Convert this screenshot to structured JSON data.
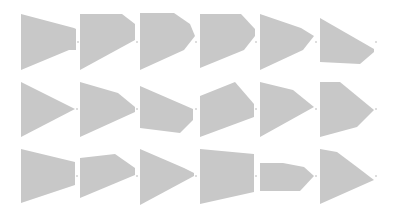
{
  "grid": {
    "rows": 3,
    "cols": 6,
    "fill_color": "#c8c8c8",
    "dot_color": "#b4b4b4"
  },
  "shapes": [
    {
      "row": 1,
      "col": 1,
      "points": [
        [
          21,
          14
        ],
        [
          74,
          28
        ],
        [
          76,
          29
        ],
        [
          76,
          50
        ],
        [
          69,
          50
        ],
        [
          21,
          70
        ]
      ],
      "dot": [
        78,
        42
      ]
    },
    {
      "row": 1,
      "col": 2,
      "points": [
        [
          80,
          14
        ],
        [
          122,
          14
        ],
        [
          135,
          24
        ],
        [
          135,
          40
        ],
        [
          80,
          70
        ]
      ],
      "dot": [
        137,
        42
      ]
    },
    {
      "row": 1,
      "col": 3,
      "points": [
        [
          140,
          13
        ],
        [
          174,
          13
        ],
        [
          190,
          24
        ],
        [
          195,
          36
        ],
        [
          184,
          50
        ],
        [
          140,
          70
        ]
      ],
      "dot": [
        196,
        42
      ]
    },
    {
      "row": 1,
      "col": 4,
      "points": [
        [
          200,
          14
        ],
        [
          241,
          14
        ],
        [
          255,
          29
        ],
        [
          255,
          36
        ],
        [
          244,
          50
        ],
        [
          200,
          68
        ]
      ],
      "dot": [
        256,
        42
      ]
    },
    {
      "row": 1,
      "col": 5,
      "points": [
        [
          260,
          14
        ],
        [
          301,
          28
        ],
        [
          314,
          36
        ],
        [
          303,
          50
        ],
        [
          260,
          70
        ]
      ],
      "dot": [
        316,
        42
      ]
    },
    {
      "row": 1,
      "col": 6,
      "points": [
        [
          320,
          18
        ],
        [
          374,
          49
        ],
        [
          374,
          52
        ],
        [
          360,
          64
        ],
        [
          320,
          62
        ]
      ],
      "dot": [
        376,
        42
      ]
    },
    {
      "row": 2,
      "col": 1,
      "points": [
        [
          21,
          82
        ],
        [
          75,
          109
        ],
        [
          21,
          137
        ]
      ],
      "dot": [
        77,
        109
      ]
    },
    {
      "row": 2,
      "col": 2,
      "points": [
        [
          80,
          82
        ],
        [
          118,
          93
        ],
        [
          135,
          107
        ],
        [
          135,
          112
        ],
        [
          80,
          137
        ]
      ],
      "dot": [
        137,
        109
      ]
    },
    {
      "row": 2,
      "col": 3,
      "points": [
        [
          140,
          86
        ],
        [
          193,
          109
        ],
        [
          193,
          120
        ],
        [
          180,
          133
        ],
        [
          140,
          128
        ]
      ],
      "dot": [
        196,
        109
      ]
    },
    {
      "row": 2,
      "col": 4,
      "points": [
        [
          200,
          96
        ],
        [
          235,
          82
        ],
        [
          254,
          104
        ],
        [
          254,
          117
        ],
        [
          200,
          137
        ]
      ],
      "dot": [
        256,
        109
      ]
    },
    {
      "row": 2,
      "col": 5,
      "points": [
        [
          260,
          82
        ],
        [
          293,
          90
        ],
        [
          314,
          107
        ],
        [
          260,
          137
        ]
      ],
      "dot": [
        316,
        109
      ]
    },
    {
      "row": 2,
      "col": 6,
      "points": [
        [
          320,
          82
        ],
        [
          340,
          82
        ],
        [
          374,
          110
        ],
        [
          357,
          127
        ],
        [
          320,
          137
        ]
      ],
      "dot": [
        376,
        109
      ]
    },
    {
      "row": 3,
      "col": 1,
      "points": [
        [
          21,
          149
        ],
        [
          75,
          162
        ],
        [
          75,
          185
        ],
        [
          60,
          190
        ],
        [
          21,
          203
        ]
      ],
      "dot": [
        77,
        176
      ]
    },
    {
      "row": 3,
      "col": 2,
      "points": [
        [
          80,
          158
        ],
        [
          115,
          154
        ],
        [
          135,
          168
        ],
        [
          135,
          175
        ],
        [
          80,
          198
        ]
      ],
      "dot": [
        137,
        176
      ]
    },
    {
      "row": 3,
      "col": 3,
      "points": [
        [
          140,
          149
        ],
        [
          184,
          168
        ],
        [
          194,
          173
        ],
        [
          194,
          176
        ],
        [
          140,
          205
        ]
      ],
      "dot": [
        196,
        176
      ]
    },
    {
      "row": 3,
      "col": 4,
      "points": [
        [
          200,
          149
        ],
        [
          254,
          154
        ],
        [
          254,
          192
        ],
        [
          200,
          204
        ]
      ],
      "dot": [
        256,
        176
      ]
    },
    {
      "row": 3,
      "col": 5,
      "points": [
        [
          260,
          163
        ],
        [
          283,
          163
        ],
        [
          304,
          167
        ],
        [
          314,
          176
        ],
        [
          300,
          191
        ],
        [
          260,
          191
        ]
      ],
      "dot": [
        316,
        176
      ]
    },
    {
      "row": 3,
      "col": 6,
      "points": [
        [
          320,
          149
        ],
        [
          337,
          152
        ],
        [
          357,
          167
        ],
        [
          374,
          180
        ],
        [
          320,
          204
        ]
      ],
      "dot": [
        376,
        176
      ]
    }
  ]
}
